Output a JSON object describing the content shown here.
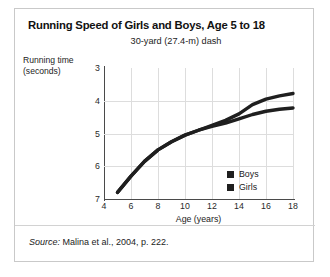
{
  "figure": {
    "title": "Running Speed of Girls and Boys, Age 5 to 18",
    "source_label": "Source:",
    "source_text": " Malina et al., 2004, p. 222."
  },
  "colors": {
    "boys": "#1f1f1f",
    "girls": "#1f1f1f",
    "grid": "#dddddd",
    "axis": "#4a4a4a",
    "frame": "#c9c9c9"
  },
  "chart_data": {
    "type": "line",
    "title": "30-yard (27.4-m) dash",
    "xlabel": "Age (years)",
    "ylabel": "Running time\n(seconds)",
    "xlim": [
      4,
      18
    ],
    "ylim": [
      3,
      7
    ],
    "y_inverted": true,
    "grid": true,
    "legend_position": "bottom-right",
    "xticks": [
      4,
      6,
      8,
      10,
      12,
      14,
      16,
      18
    ],
    "yticks": [
      3,
      4,
      5,
      6,
      7
    ],
    "x": [
      5,
      6,
      7,
      8,
      9,
      10,
      11,
      12,
      13,
      14,
      15,
      16,
      17,
      18
    ],
    "series": [
      {
        "name": "Boys",
        "values": [
          6.8,
          6.3,
          5.85,
          5.5,
          5.25,
          5.05,
          4.9,
          4.75,
          4.6,
          4.4,
          4.12,
          3.95,
          3.85,
          3.78
        ]
      },
      {
        "name": "Girls",
        "values": [
          6.8,
          6.3,
          5.85,
          5.5,
          5.25,
          5.05,
          4.9,
          4.78,
          4.68,
          4.55,
          4.42,
          4.32,
          4.26,
          4.22
        ]
      }
    ]
  }
}
